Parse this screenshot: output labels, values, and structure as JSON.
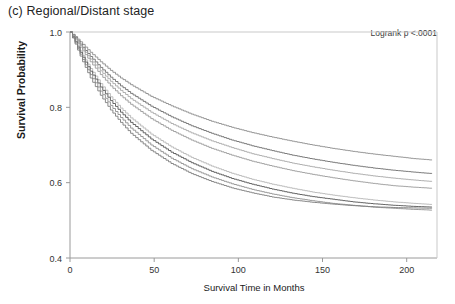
{
  "panel": {
    "title": "(c) Regional/Distant stage"
  },
  "annotation": {
    "logrank": "Logrank p <.0001"
  },
  "chart_data": {
    "type": "line",
    "title": "(c) Regional/Distant stage",
    "xlabel": "Survival Time in Months",
    "ylabel": "Survival Probability",
    "xlim": [
      0,
      218
    ],
    "ylim": [
      0.4,
      1.0
    ],
    "xticks": [
      0,
      50,
      100,
      150,
      200
    ],
    "xtick_labels": [
      "0",
      "50",
      "100",
      "150",
      "200"
    ],
    "yticks": [
      0.4,
      0.6,
      0.8,
      1.0
    ],
    "ytick_labels": [
      "0.4",
      "0.6",
      "0.8",
      "1.0"
    ],
    "grid": false,
    "legend": "none",
    "annotations": [
      "Logrank p <.0001"
    ],
    "x": [
      0,
      3,
      6,
      9,
      12,
      18,
      24,
      30,
      36,
      48,
      60,
      72,
      84,
      96,
      108,
      120,
      132,
      144,
      156,
      168,
      180,
      192,
      204,
      215
    ],
    "series": [
      {
        "name": "curve-1",
        "color": "#8c8c8c",
        "values": [
          1.0,
          0.988,
          0.974,
          0.96,
          0.946,
          0.921,
          0.898,
          0.878,
          0.86,
          0.829,
          0.804,
          0.782,
          0.763,
          0.747,
          0.733,
          0.721,
          0.71,
          0.7,
          0.691,
          0.683,
          0.676,
          0.67,
          0.664,
          0.66
        ]
      },
      {
        "name": "curve-2",
        "color": "#6e6e6e",
        "values": [
          1.0,
          0.985,
          0.968,
          0.951,
          0.935,
          0.906,
          0.88,
          0.857,
          0.837,
          0.803,
          0.775,
          0.751,
          0.731,
          0.713,
          0.698,
          0.685,
          0.673,
          0.663,
          0.654,
          0.646,
          0.639,
          0.633,
          0.628,
          0.624
        ]
      },
      {
        "name": "curve-3",
        "color": "#a8a8a8",
        "values": [
          1.0,
          0.983,
          0.964,
          0.946,
          0.928,
          0.897,
          0.869,
          0.845,
          0.823,
          0.787,
          0.757,
          0.732,
          0.711,
          0.693,
          0.677,
          0.664,
          0.652,
          0.642,
          0.633,
          0.625,
          0.618,
          0.612,
          0.607,
          0.603
        ]
      },
      {
        "name": "curve-4",
        "color": "#9a9a9a",
        "values": [
          1.0,
          0.981,
          0.96,
          0.94,
          0.921,
          0.887,
          0.857,
          0.831,
          0.808,
          0.77,
          0.739,
          0.713,
          0.691,
          0.673,
          0.657,
          0.644,
          0.632,
          0.622,
          0.613,
          0.605,
          0.598,
          0.592,
          0.588,
          0.585
        ]
      },
      {
        "name": "curve-5",
        "color": "#b5b5b5",
        "values": [
          1.0,
          0.976,
          0.95,
          0.926,
          0.903,
          0.863,
          0.828,
          0.798,
          0.772,
          0.729,
          0.695,
          0.667,
          0.644,
          0.625,
          0.609,
          0.596,
          0.585,
          0.575,
          0.567,
          0.56,
          0.554,
          0.549,
          0.545,
          0.542
        ]
      },
      {
        "name": "curve-6",
        "color": "#555555",
        "values": [
          1.0,
          0.974,
          0.946,
          0.92,
          0.896,
          0.854,
          0.818,
          0.787,
          0.76,
          0.716,
          0.681,
          0.653,
          0.63,
          0.611,
          0.596,
          0.583,
          0.572,
          0.563,
          0.556,
          0.549,
          0.544,
          0.54,
          0.537,
          0.535
        ]
      },
      {
        "name": "curve-7",
        "color": "#8f8f8f",
        "values": [
          1.0,
          0.971,
          0.941,
          0.913,
          0.887,
          0.843,
          0.805,
          0.773,
          0.745,
          0.7,
          0.665,
          0.637,
          0.615,
          0.597,
          0.582,
          0.57,
          0.56,
          0.552,
          0.545,
          0.54,
          0.535,
          0.532,
          0.529,
          0.527
        ]
      },
      {
        "name": "curve-8",
        "color": "#7d7d7d",
        "values": [
          1.0,
          0.968,
          0.936,
          0.906,
          0.878,
          0.832,
          0.793,
          0.76,
          0.731,
          0.686,
          0.651,
          0.624,
          0.603,
          0.586,
          0.573,
          0.562,
          0.554,
          0.548,
          0.543,
          0.539,
          0.536,
          0.534,
          0.533,
          0.532
        ]
      }
    ]
  }
}
